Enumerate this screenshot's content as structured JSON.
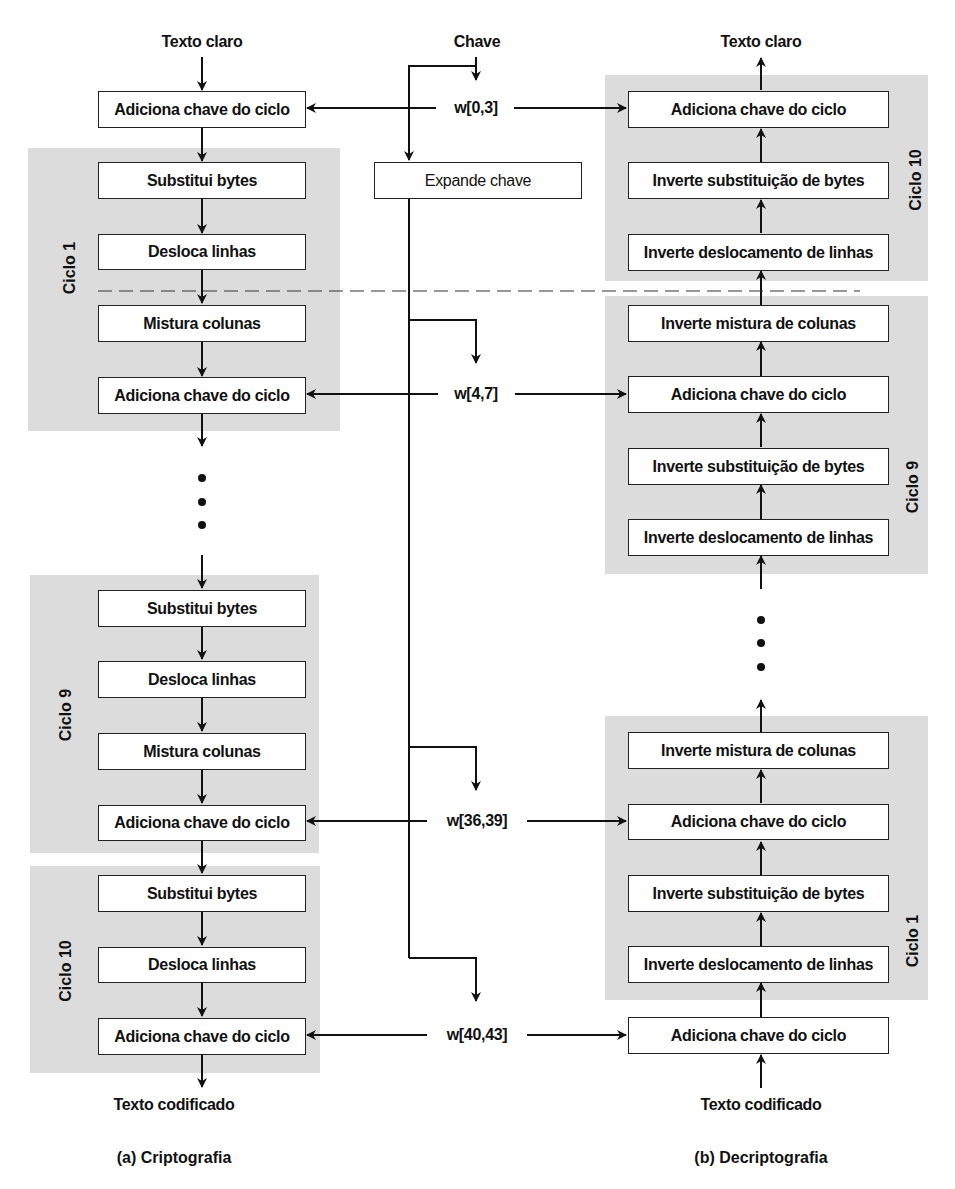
{
  "diagram": {
    "encryption": {
      "input_label": "Texto claro",
      "initial_step": "Adiciona chave do ciclo",
      "round1": {
        "label": "Ciclo 1",
        "steps": [
          "Substitui bytes",
          "Desloca linhas",
          "Mistura colunas",
          "Adiciona chave do ciclo"
        ]
      },
      "round9": {
        "label": "Ciclo 9",
        "steps": [
          "Substitui bytes",
          "Desloca linhas",
          "Mistura colunas",
          "Adiciona chave do ciclo"
        ]
      },
      "round10": {
        "label": "Ciclo 10",
        "steps": [
          "Substitui bytes",
          "Desloca linhas",
          "Adiciona chave do ciclo"
        ]
      },
      "output_label": "Texto codificado",
      "caption": "(a) Criptografia"
    },
    "key_schedule": {
      "key_label": "Chave",
      "expand_step": "Expande chave",
      "round_keys": [
        "w[0,3]",
        "w[4,7]",
        "w[36,39]",
        "w[40,43]"
      ]
    },
    "decryption": {
      "output_label": "Texto claro",
      "round10": {
        "label": "Ciclo 10",
        "steps": [
          "Adiciona chave do ciclo",
          "Inverte substituição de bytes",
          "Inverte deslocamento de linhas"
        ]
      },
      "round9": {
        "label": "Ciclo 9",
        "steps": [
          "Inverte mistura de colunas",
          "Adiciona chave do ciclo",
          "Inverte substituição de bytes",
          "Inverte deslocamento de linhas"
        ]
      },
      "round1": {
        "label": "Ciclo 1",
        "steps": [
          "Inverte mistura de colunas",
          "Adiciona chave do ciclo",
          "Inverte substituição de bytes",
          "Inverte deslocamento de linhas"
        ]
      },
      "initial_step": "Adiciona chave do ciclo",
      "input_label": "Texto codificado",
      "caption": "(b) Decriptografia"
    },
    "colors": {
      "round_background": "#dcdcdc",
      "box_fill": "#ffffff",
      "line": "#111111"
    }
  }
}
